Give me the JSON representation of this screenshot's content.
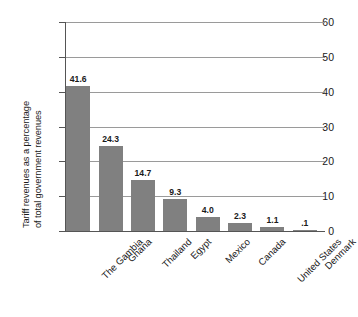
{
  "chart_data": {
    "type": "bar",
    "title": "",
    "subtitle": "",
    "xlabel": "",
    "ylabel": "Tariff revenues as a percentage of total government revenues",
    "ylabel_line1": "Tariff revenues as a percentage",
    "ylabel_line2": "of total government revenues",
    "categories": [
      "The Gambia",
      "Ghana",
      "Thailand",
      "Egypt",
      "Mexico",
      "Canada",
      "United States",
      "Denmark"
    ],
    "values": [
      41.6,
      24.3,
      14.7,
      9.3,
      4.0,
      2.3,
      1.1,
      0.1
    ],
    "value_labels": [
      "41.6",
      "24.3",
      "14.7",
      "9.3",
      "4.0",
      "2.3",
      "1.1",
      ".1"
    ],
    "ylim": [
      0,
      60
    ],
    "yticks": [
      0,
      10,
      20,
      30,
      40,
      50,
      60
    ],
    "ytick_labels": [
      "0",
      "10",
      "20",
      "30",
      "40",
      "50",
      "60"
    ],
    "grid": true,
    "grid_axis": "y",
    "legend": false,
    "legend_position": "none",
    "bar_color": "#808080",
    "grid_color": "#9a9a9a",
    "axis_color": "#555555",
    "text_color": "#1a1a1a",
    "background_color": "#ffffff"
  }
}
